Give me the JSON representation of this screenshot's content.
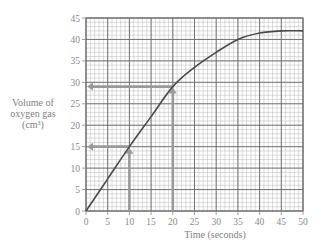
{
  "chart_data": {
    "type": "line",
    "title": "",
    "xlabel": "Time (seconds)",
    "ylabel": "Volume of oxygen gas (cm³)",
    "xlim": [
      0,
      50
    ],
    "ylim": [
      0,
      45
    ],
    "xticks": [
      0,
      5,
      10,
      15,
      20,
      25,
      30,
      35,
      40,
      45,
      50
    ],
    "yticks": [
      0,
      5,
      10,
      15,
      20,
      25,
      30,
      35,
      40,
      45
    ],
    "grid": true,
    "legend": null,
    "series": [
      {
        "name": "Volume of oxygen gas",
        "x": [
          0,
          5,
          10,
          15,
          20,
          25,
          30,
          35,
          40,
          45,
          50
        ],
        "y": [
          0,
          7.5,
          15,
          22,
          29,
          33.5,
          37,
          40,
          41.5,
          42,
          42
        ]
      }
    ],
    "annotations": [
      {
        "type": "arrow-reading",
        "x": 10,
        "y": 15,
        "description": "Vertical arrow up from t=10 to curve, horizontal arrow left to y-axis at 15"
      },
      {
        "type": "arrow-reading",
        "x": 20,
        "y": 29,
        "description": "Vertical arrow up from t=20 to curve, horizontal arrow left to y-axis at 29"
      }
    ]
  },
  "labels": {
    "ylabel_line1": "Volume of",
    "ylabel_line2": "oxygen gas",
    "ylabel_line3": "(cm³)",
    "xlabel": "Time (seconds)"
  }
}
